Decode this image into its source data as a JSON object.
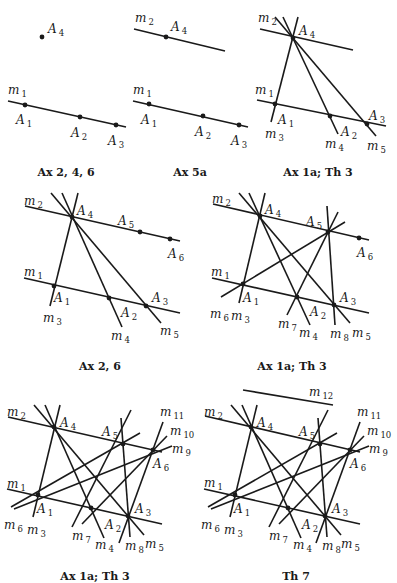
{
  "figure": {
    "panels": [
      {
        "id": "p1",
        "caption": "Ax 2, 4, 6",
        "lines": [
          {
            "name": "m",
            "sub": "1",
            "x1": 8,
            "y1": 101,
            "x2": 126,
            "y2": 127,
            "lx": 8,
            "ly": 94
          }
        ],
        "points": [
          {
            "name": "A",
            "sub": "4",
            "x": 42,
            "y": 37,
            "lx": 48,
            "ly": 33
          },
          {
            "name": "A",
            "sub": "1",
            "x": 25,
            "y": 105,
            "lx": 16,
            "ly": 124
          },
          {
            "name": "A",
            "sub": "2",
            "x": 80,
            "y": 117,
            "lx": 71,
            "ly": 137
          },
          {
            "name": "A",
            "sub": "3",
            "x": 116,
            "y": 125,
            "lx": 108,
            "ly": 145
          }
        ],
        "caption_pos": {
          "x": 66,
          "y": 176
        }
      },
      {
        "id": "p2",
        "caption": "Ax 5a",
        "lines": [
          {
            "name": "m",
            "sub": "2",
            "x1": 134,
            "y1": 29,
            "x2": 225,
            "y2": 51,
            "lx": 135,
            "ly": 22
          },
          {
            "name": "m",
            "sub": "1",
            "x1": 133,
            "y1": 101,
            "x2": 248,
            "y2": 127,
            "lx": 133,
            "ly": 94
          }
        ],
        "points": [
          {
            "name": "A",
            "sub": "4",
            "x": 166,
            "y": 37,
            "lx": 171,
            "ly": 31
          },
          {
            "name": "A",
            "sub": "1",
            "x": 149,
            "y": 104,
            "lx": 141,
            "ly": 124
          },
          {
            "name": "A",
            "sub": "2",
            "x": 203,
            "y": 116,
            "lx": 195,
            "ly": 136
          },
          {
            "name": "A",
            "sub": "3",
            "x": 239,
            "y": 125,
            "lx": 231,
            "ly": 145
          }
        ],
        "caption_pos": {
          "x": 190,
          "y": 176
        }
      },
      {
        "id": "p3",
        "caption": "Ax 1a; Th 3",
        "lines": [
          {
            "name": "m",
            "sub": "2",
            "x1": 260,
            "y1": 29,
            "x2": 353,
            "y2": 50,
            "lx": 258,
            "ly": 22
          },
          {
            "name": "m",
            "sub": "1",
            "x1": 257,
            "y1": 100,
            "x2": 386,
            "y2": 126,
            "lx": 255,
            "ly": 94
          },
          {
            "name": "m",
            "sub": "3",
            "x1": 298,
            "y1": 17,
            "x2": 271,
            "y2": 122,
            "lx": 265,
            "ly": 138
          },
          {
            "name": "m",
            "sub": "4",
            "x1": 283,
            "y1": 17,
            "x2": 338,
            "y2": 134,
            "lx": 325,
            "ly": 148
          },
          {
            "name": "m",
            "sub": "5",
            "x1": 275,
            "y1": 17,
            "x2": 376,
            "y2": 136,
            "lx": 367,
            "ly": 150
          }
        ],
        "points": [
          {
            "name": "A",
            "sub": "4",
            "x": 293,
            "y": 38,
            "lx": 299,
            "ly": 35
          },
          {
            "name": "A",
            "sub": "1",
            "x": 275,
            "y": 104,
            "lx": 278,
            "ly": 124
          },
          {
            "name": "A",
            "sub": "2",
            "x": 330,
            "y": 116,
            "lx": 341,
            "ly": 136
          },
          {
            "name": "A",
            "sub": "3",
            "x": 367,
            "y": 124,
            "lx": 369,
            "ly": 120
          }
        ],
        "caption_pos": {
          "x": 318,
          "y": 176
        }
      },
      {
        "id": "p4",
        "caption": "Ax 2, 6",
        "lines": [
          {
            "name": "m",
            "sub": "2",
            "x1": 25,
            "y1": 206,
            "x2": 180,
            "y2": 241,
            "lx": 24,
            "ly": 205
          },
          {
            "name": "m",
            "sub": "1",
            "x1": 24,
            "y1": 278,
            "x2": 180,
            "y2": 313,
            "lx": 24,
            "ly": 276
          },
          {
            "name": "m",
            "sub": "3",
            "x1": 78,
            "y1": 193,
            "x2": 50,
            "y2": 306,
            "lx": 43,
            "ly": 322
          },
          {
            "name": "m",
            "sub": "4",
            "x1": 62,
            "y1": 193,
            "x2": 122,
            "y2": 327,
            "lx": 111,
            "ly": 340
          },
          {
            "name": "m",
            "sub": "5",
            "x1": 51,
            "y1": 193,
            "x2": 161,
            "y2": 323,
            "lx": 160,
            "ly": 335
          }
        ],
        "points": [
          {
            "name": "A",
            "sub": "4",
            "x": 72,
            "y": 217,
            "lx": 77,
            "ly": 215
          },
          {
            "name": "A",
            "sub": "5",
            "x": 140,
            "y": 232,
            "lx": 118,
            "ly": 225
          },
          {
            "name": "A",
            "sub": "6",
            "x": 170,
            "y": 239,
            "lx": 168,
            "ly": 258
          },
          {
            "name": "A",
            "sub": "1",
            "x": 54,
            "y": 286,
            "lx": 54,
            "ly": 302
          },
          {
            "name": "A",
            "sub": "2",
            "x": 109,
            "y": 298,
            "lx": 121,
            "ly": 317
          },
          {
            "name": "A",
            "sub": "3",
            "x": 146,
            "y": 306,
            "lx": 152,
            "ly": 302
          }
        ],
        "caption_pos": {
          "x": 100,
          "y": 370
        }
      },
      {
        "id": "p5",
        "caption": "Ax 1a; Th 3",
        "lines": [
          {
            "name": "m",
            "sub": "2",
            "x1": 213,
            "y1": 204,
            "x2": 369,
            "y2": 240,
            "lx": 212,
            "ly": 203
          },
          {
            "name": "m",
            "sub": "1",
            "x1": 212,
            "y1": 278,
            "x2": 369,
            "y2": 313,
            "lx": 211,
            "ly": 276
          },
          {
            "name": "m",
            "sub": "3",
            "x1": 265,
            "y1": 193,
            "x2": 239,
            "y2": 303,
            "lx": 231,
            "ly": 320
          },
          {
            "name": "m",
            "sub": "4",
            "x1": 249,
            "y1": 193,
            "x2": 310,
            "y2": 325,
            "lx": 299,
            "ly": 337
          },
          {
            "name": "m",
            "sub": "5",
            "x1": 239,
            "y1": 193,
            "x2": 350,
            "y2": 323,
            "lx": 352,
            "ly": 337
          },
          {
            "name": "m",
            "sub": "6",
            "x1": 221,
            "y1": 297,
            "x2": 345,
            "y2": 222,
            "lx": 210,
            "ly": 318
          },
          {
            "name": "m",
            "sub": "7",
            "x1": 287,
            "y1": 315,
            "x2": 338,
            "y2": 212,
            "lx": 278,
            "ly": 328
          },
          {
            "name": "m",
            "sub": "8",
            "x1": 327,
            "y1": 206,
            "x2": 335,
            "y2": 325,
            "lx": 330,
            "ly": 338
          }
        ],
        "points": [
          {
            "name": "A",
            "sub": "4",
            "x": 260,
            "y": 216,
            "lx": 265,
            "ly": 214
          },
          {
            "name": "A",
            "sub": "5",
            "x": 328,
            "y": 232,
            "lx": 306,
            "ly": 226
          },
          {
            "name": "A",
            "sub": "6",
            "x": 359,
            "y": 238,
            "lx": 357,
            "ly": 257
          },
          {
            "name": "A",
            "sub": "1",
            "x": 243,
            "y": 284,
            "lx": 243,
            "ly": 302
          },
          {
            "name": "A",
            "sub": "2",
            "x": 297,
            "y": 297,
            "lx": 310,
            "ly": 316
          },
          {
            "name": "A",
            "sub": "3",
            "x": 334,
            "y": 305,
            "lx": 340,
            "ly": 302
          }
        ],
        "caption_pos": {
          "x": 292,
          "y": 370
        }
      },
      {
        "id": "p6",
        "caption": "Ax 1a; Th 3",
        "lines": [
          {
            "name": "m",
            "sub": "2",
            "x1": 8,
            "y1": 417,
            "x2": 162,
            "y2": 452,
            "lx": 7,
            "ly": 416
          },
          {
            "name": "m",
            "sub": "1",
            "x1": 7,
            "y1": 489,
            "x2": 162,
            "y2": 524,
            "lx": 7,
            "ly": 488
          },
          {
            "name": "m",
            "sub": "3",
            "x1": 60,
            "y1": 405,
            "x2": 33,
            "y2": 517,
            "lx": 27,
            "ly": 534
          },
          {
            "name": "m",
            "sub": "4",
            "x1": 45,
            "y1": 405,
            "x2": 104,
            "y2": 538,
            "lx": 95,
            "ly": 549
          },
          {
            "name": "m",
            "sub": "5",
            "x1": 34,
            "y1": 405,
            "x2": 144,
            "y2": 535,
            "lx": 145,
            "ly": 548
          },
          {
            "name": "m",
            "sub": "6",
            "x1": 11,
            "y1": 507,
            "x2": 140,
            "y2": 433,
            "lx": 4,
            "ly": 529
          },
          {
            "name": "m",
            "sub": "7",
            "x1": 72,
            "y1": 527,
            "x2": 131,
            "y2": 410,
            "lx": 72,
            "ly": 540
          },
          {
            "name": "m",
            "sub": "8",
            "x1": 121,
            "y1": 418,
            "x2": 130,
            "y2": 537,
            "lx": 125,
            "ly": 550
          },
          {
            "name": "m",
            "sub": "9",
            "x1": 14,
            "y1": 509,
            "x2": 172,
            "y2": 446,
            "lx": 172,
            "ly": 453
          },
          {
            "name": "m",
            "sub": "10",
            "x1": 82,
            "y1": 524,
            "x2": 167,
            "y2": 436,
            "lx": 170,
            "ly": 435
          },
          {
            "name": "m",
            "sub": "11",
            "x1": 119,
            "y1": 543,
            "x2": 163,
            "y2": 422,
            "lx": 160,
            "ly": 416
          }
        ],
        "points": [
          {
            "name": "A",
            "sub": "4",
            "x": 54,
            "y": 427,
            "lx": 60,
            "ly": 427
          },
          {
            "name": "A",
            "sub": "5",
            "x": 123,
            "y": 444,
            "lx": 102,
            "ly": 436
          },
          {
            "name": "A",
            "sub": "6",
            "x": 153,
            "y": 450,
            "lx": 153,
            "ly": 468
          },
          {
            "name": "A",
            "sub": "1",
            "x": 38,
            "y": 495,
            "lx": 37,
            "ly": 513
          },
          {
            "name": "A",
            "sub": "2",
            "x": 91,
            "y": 508,
            "lx": 105,
            "ly": 529
          },
          {
            "name": "A",
            "sub": "3",
            "x": 128,
            "y": 516,
            "lx": 135,
            "ly": 513
          }
        ],
        "caption_pos": {
          "x": 95,
          "y": 580
        }
      },
      {
        "id": "p7",
        "caption": "Th 7",
        "lines": [
          {
            "name": "m",
            "sub": "12",
            "x1": 243,
            "y1": 390,
            "x2": 333,
            "y2": 405,
            "lx": 309,
            "ly": 396
          },
          {
            "name": "m",
            "sub": "2",
            "x1": 205,
            "y1": 416,
            "x2": 360,
            "y2": 452,
            "lx": 204,
            "ly": 416
          },
          {
            "name": "m",
            "sub": "1",
            "x1": 204,
            "y1": 489,
            "x2": 360,
            "y2": 524,
            "lx": 204,
            "ly": 487
          },
          {
            "name": "m",
            "sub": "3",
            "x1": 257,
            "y1": 405,
            "x2": 230,
            "y2": 517,
            "lx": 224,
            "ly": 534
          },
          {
            "name": "m",
            "sub": "4",
            "x1": 242,
            "y1": 405,
            "x2": 301,
            "y2": 538,
            "lx": 293,
            "ly": 549
          },
          {
            "name": "m",
            "sub": "5",
            "x1": 231,
            "y1": 405,
            "x2": 341,
            "y2": 535,
            "lx": 341,
            "ly": 548
          },
          {
            "name": "m",
            "sub": "6",
            "x1": 208,
            "y1": 507,
            "x2": 337,
            "y2": 433,
            "lx": 201,
            "ly": 529
          },
          {
            "name": "m",
            "sub": "7",
            "x1": 269,
            "y1": 527,
            "x2": 328,
            "y2": 410,
            "lx": 269,
            "ly": 540
          },
          {
            "name": "m",
            "sub": "8",
            "x1": 318,
            "y1": 418,
            "x2": 327,
            "y2": 537,
            "lx": 322,
            "ly": 550
          },
          {
            "name": "m",
            "sub": "9",
            "x1": 211,
            "y1": 509,
            "x2": 369,
            "y2": 446,
            "lx": 369,
            "ly": 453
          },
          {
            "name": "m",
            "sub": "10",
            "x1": 279,
            "y1": 524,
            "x2": 364,
            "y2": 436,
            "lx": 367,
            "ly": 435
          },
          {
            "name": "m",
            "sub": "11",
            "x1": 316,
            "y1": 543,
            "x2": 360,
            "y2": 422,
            "lx": 357,
            "ly": 416
          }
        ],
        "points": [
          {
            "name": "A",
            "sub": "4",
            "x": 251,
            "y": 427,
            "lx": 257,
            "ly": 427
          },
          {
            "name": "A",
            "sub": "5",
            "x": 320,
            "y": 444,
            "lx": 299,
            "ly": 436
          },
          {
            "name": "A",
            "sub": "6",
            "x": 350,
            "y": 450,
            "lx": 350,
            "ly": 468
          },
          {
            "name": "A",
            "sub": "1",
            "x": 235,
            "y": 495,
            "lx": 234,
            "ly": 513
          },
          {
            "name": "A",
            "sub": "2",
            "x": 288,
            "y": 508,
            "lx": 302,
            "ly": 529
          },
          {
            "name": "A",
            "sub": "3",
            "x": 325,
            "y": 516,
            "lx": 332,
            "ly": 513
          }
        ],
        "caption_pos": {
          "x": 296,
          "y": 580
        }
      }
    ]
  }
}
